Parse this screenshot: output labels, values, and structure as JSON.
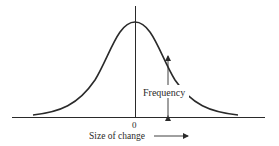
{
  "diagram": {
    "type": "normal-distribution-curve",
    "x_axis_origin_label": "0",
    "x_axis_label": "Size of change",
    "y_annotation_label": "Frequency",
    "colors": {
      "stroke": "#2a2a2a",
      "background": "#ffffff"
    }
  }
}
